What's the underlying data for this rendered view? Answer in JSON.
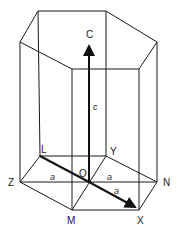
{
  "diagram": {
    "labels": {
      "c_axis": "C",
      "c_length": "c",
      "L": "L",
      "Y": "Y",
      "Z": "Z",
      "O": "O",
      "N": "N",
      "M": "M",
      "X": "X",
      "a_left": "a",
      "a_right": "a",
      "a_diag": "a"
    },
    "colors": {
      "line": "#1a1a1a",
      "axis": "#111111",
      "background": "#ffffff"
    }
  }
}
